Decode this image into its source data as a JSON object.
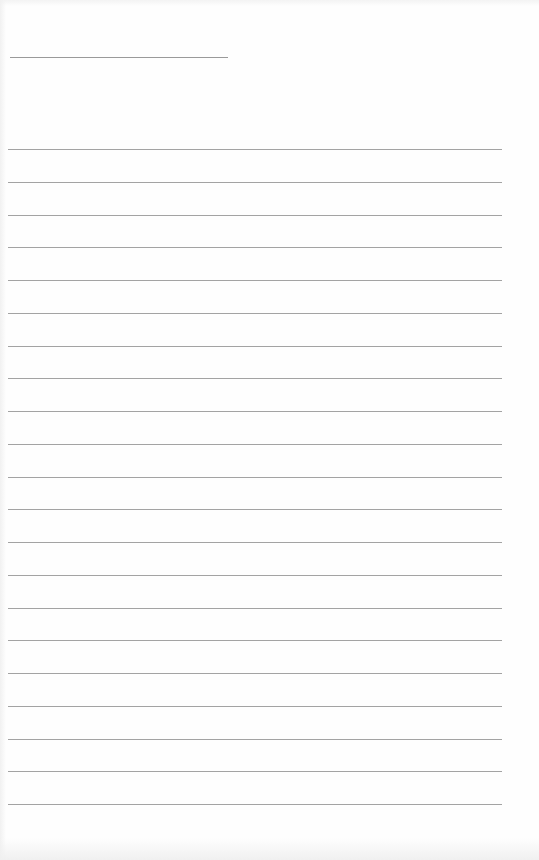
{
  "page": {
    "type": "blank lined paper",
    "background_color": "#fefefe",
    "line_color": "#a3a3a3",
    "header_line": {
      "x": 10,
      "y": 57,
      "width": 218
    },
    "ruled_lines": {
      "count": 21,
      "first_y": 149,
      "spacing": 32.75,
      "x": 8,
      "width": 494
    }
  }
}
